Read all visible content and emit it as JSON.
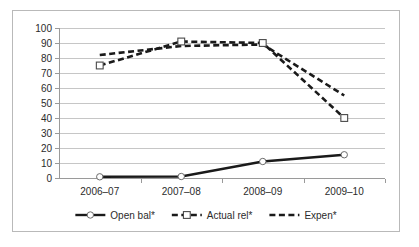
{
  "chart_data": {
    "type": "line",
    "title": "",
    "xlabel": "",
    "ylabel": "",
    "categories": [
      "2006–07",
      "2007–08",
      "2008–09",
      "2009–10"
    ],
    "ylim": [
      0,
      100
    ],
    "yticks": [
      0,
      10,
      20,
      30,
      40,
      50,
      60,
      70,
      80,
      90,
      100
    ],
    "grid": true,
    "legend_position": "bottom",
    "series": [
      {
        "name": "Open bal*",
        "values": [
          0.8,
          1.0,
          11.0,
          15.5
        ],
        "style": "solid",
        "marker": "circle",
        "color": "#1a1a1a"
      },
      {
        "name": "Actual rel*",
        "values": [
          75,
          91,
          90,
          40
        ],
        "style": "dashed",
        "marker": "square",
        "color": "#1a1a1a"
      },
      {
        "name": "Expen*",
        "values": [
          82,
          88,
          89,
          55
        ],
        "style": "dashed",
        "marker": "none",
        "color": "#1a1a1a"
      }
    ]
  },
  "legend": {
    "items": [
      {
        "label": "Open bal*"
      },
      {
        "label": "Actual rel*"
      },
      {
        "label": "Expen*"
      }
    ]
  }
}
